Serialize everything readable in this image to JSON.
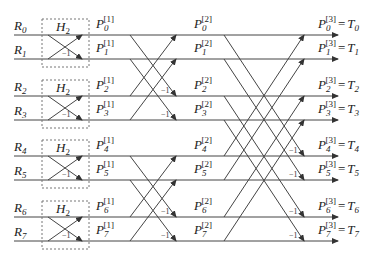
{
  "diagram": {
    "title": "",
    "inputs": [
      "R0",
      "R1",
      "R2",
      "R3",
      "R4",
      "R5",
      "R6",
      "R7"
    ],
    "block_label": "H2",
    "minus_one_label": "−1",
    "stage1_outputs": [
      "P0[1]",
      "P1[1]",
      "P2[1]",
      "P3[1]",
      "P4[1]",
      "P5[1]",
      "P6[1]",
      "P7[1]"
    ],
    "stage2_outputs": [
      "P0[2]",
      "P1[2]",
      "P2[2]",
      "P3[2]",
      "P4[2]",
      "P5[2]",
      "P6[2]",
      "P7[2]"
    ],
    "final_outputs": [
      "P0[3] = T0",
      "P1[3] = T1",
      "P2[3] = T2",
      "P3[3] = T3",
      "P4[3] = T4",
      "P5[3] = T5",
      "P6[3] = T6",
      "P7[3] = T7"
    ],
    "rows": [
      {
        "in_var": "R",
        "in_idx": "0",
        "p": "P",
        "idx": "0",
        "s1": "[1]",
        "s2": "[2]",
        "s3": "[3]",
        "t": "T",
        "eq": "="
      },
      {
        "in_var": "R",
        "in_idx": "1",
        "p": "P",
        "idx": "1",
        "s1": "[1]",
        "s2": "[2]",
        "s3": "[3]",
        "t": "T",
        "eq": "="
      },
      {
        "in_var": "R",
        "in_idx": "2",
        "p": "P",
        "idx": "2",
        "s1": "[1]",
        "s2": "[2]",
        "s3": "[3]",
        "t": "T",
        "eq": "="
      },
      {
        "in_var": "R",
        "in_idx": "3",
        "p": "P",
        "idx": "3",
        "s1": "[1]",
        "s2": "[2]",
        "s3": "[3]",
        "t": "T",
        "eq": "="
      },
      {
        "in_var": "R",
        "in_idx": "4",
        "p": "P",
        "idx": "4",
        "s1": "[1]",
        "s2": "[2]",
        "s3": "[3]",
        "t": "T",
        "eq": "="
      },
      {
        "in_var": "R",
        "in_idx": "5",
        "p": "P",
        "idx": "5",
        "s1": "[1]",
        "s2": "[2]",
        "s3": "[3]",
        "t": "T",
        "eq": "="
      },
      {
        "in_var": "R",
        "in_idx": "6",
        "p": "P",
        "idx": "6",
        "s1": "[1]",
        "s2": "[2]",
        "s3": "[3]",
        "t": "T",
        "eq": "="
      },
      {
        "in_var": "R",
        "in_idx": "7",
        "p": "P",
        "idx": "7",
        "s1": "[1]",
        "s2": "[2]",
        "s3": "[3]",
        "t": "T",
        "eq": "="
      }
    ],
    "h2": {
      "var": "H",
      "sub": "2"
    },
    "colors": {
      "line": "#333333",
      "box": "#666666",
      "text": "#222222"
    }
  }
}
